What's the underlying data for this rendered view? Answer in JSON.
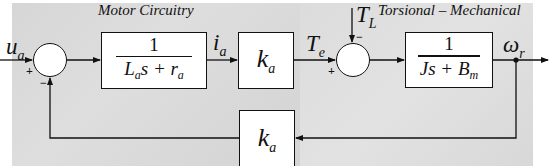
{
  "diagram": {
    "type": "control-block-diagram",
    "panels": {
      "left": {
        "title": "Motor Circuitry"
      },
      "right": {
        "title": "Torsional – Mechanical"
      }
    },
    "blocks": [
      {
        "id": "armature",
        "kind": "transfer-function",
        "numerator": "1",
        "denominator_parts": [
          "L",
          "a",
          "s + r",
          "a"
        ]
      },
      {
        "id": "torque-const",
        "kind": "gain",
        "symbol": "k",
        "subscript": "a"
      },
      {
        "id": "mech",
        "kind": "transfer-function",
        "numerator": "1",
        "denominator_parts": [
          "Js + B",
          "m"
        ]
      },
      {
        "id": "back-emf",
        "kind": "gain",
        "symbol": "k",
        "subscript": "a"
      }
    ],
    "summing_junctions": [
      {
        "id": "sum-voltage",
        "inputs": [
          {
            "signal": "u_a",
            "sign": "+"
          },
          {
            "signal": "back-emf",
            "sign": "−"
          }
        ]
      },
      {
        "id": "sum-torque",
        "inputs": [
          {
            "signal": "T_e",
            "sign": "+"
          },
          {
            "signal": "T_L",
            "sign": "−"
          }
        ]
      }
    ],
    "signals": {
      "input": {
        "symbol": "u",
        "subscript": "a"
      },
      "current": {
        "symbol": "i",
        "subscript": "a"
      },
      "elec_torque": {
        "symbol": "T",
        "subscript": "e"
      },
      "load_torque": {
        "symbol": "T",
        "subscript": "L"
      },
      "output": {
        "symbol": "ω",
        "subscript": "r"
      }
    },
    "signs": {
      "plus": "+",
      "minus": "−"
    },
    "edges": [
      [
        "u_a",
        "sum-voltage"
      ],
      [
        "sum-voltage",
        "armature"
      ],
      [
        "armature",
        "torque-const"
      ],
      [
        "torque-const",
        "sum-torque"
      ],
      [
        "T_L",
        "sum-torque"
      ],
      [
        "sum-torque",
        "mech"
      ],
      [
        "mech",
        "omega_r"
      ],
      [
        "omega_r",
        "back-emf"
      ],
      [
        "back-emf",
        "sum-voltage"
      ]
    ]
  }
}
